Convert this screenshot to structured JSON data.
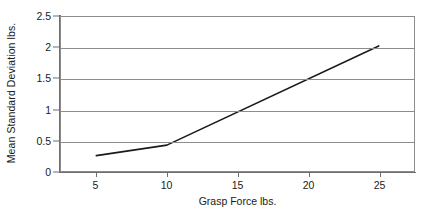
{
  "chart_data": {
    "type": "line",
    "title": "",
    "xlabel": "Grasp Force lbs.",
    "ylabel": "Mean Standard Deviation lbs.",
    "xlim": [
      2.5,
      27.5
    ],
    "ylim": [
      0,
      2.5
    ],
    "xticks": [
      5,
      10,
      15,
      20,
      25
    ],
    "yticks": [
      0,
      0.5,
      1,
      1.5,
      2,
      2.5
    ],
    "xtick_labels": [
      "5",
      "10",
      "15",
      "20",
      "25"
    ],
    "ytick_labels": [
      "0",
      "0.5",
      "1",
      "1.5",
      "2",
      "2.5"
    ],
    "grid": "horizontal",
    "legend": "none",
    "series": [
      {
        "name": "Mean Standard Deviation",
        "color": "#1a1a1a",
        "x": [
          5,
          10,
          25
        ],
        "values": [
          0.25,
          0.42,
          2.03
        ]
      }
    ]
  },
  "axes": {
    "y_title": "Mean Standard Deviation lbs.",
    "x_title": "Grasp Force lbs."
  },
  "colors": {
    "line": "#1a1a1a",
    "grid": "#8c8c8c",
    "axis": "#6e6e6e",
    "background": "#ffffff",
    "text": "#1a1a1a"
  }
}
